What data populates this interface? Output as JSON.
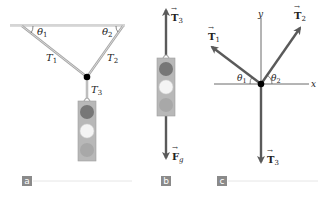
{
  "figure": {
    "panels": [
      {
        "id": "a",
        "tag": "a",
        "description": "Traffic light suspended from ceiling by two cables",
        "labels": {
          "theta1": "θ",
          "theta1_sub": "1",
          "theta2": "θ",
          "theta2_sub": "2",
          "T1": "T",
          "T1_sub": "1",
          "T2": "T",
          "T2_sub": "2",
          "T3": "T",
          "T3_sub": "3"
        }
      },
      {
        "id": "b",
        "tag": "b",
        "description": "Free-body diagram of traffic light",
        "labels": {
          "T3": "T",
          "T3_sub": "3",
          "Fg": "F",
          "Fg_sub": "g"
        }
      },
      {
        "id": "c",
        "tag": "c",
        "description": "Free-body diagram of knot with axes",
        "labels": {
          "y_axis": "y",
          "x_axis": "x",
          "T1": "T",
          "T1_sub": "1",
          "T2": "T",
          "T2_sub": "2",
          "T3": "T",
          "T3_sub": "3",
          "theta1": "θ",
          "theta1_sub": "1",
          "theta2": "θ",
          "theta2_sub": "2"
        }
      }
    ],
    "colors": {
      "ceiling": "#dcdcdc",
      "cable": "#9a9a9a",
      "vector": "#5a5a5a",
      "axis": "#333333",
      "knot": "#000000",
      "light_housing": "#b5b5b5",
      "light_top": "#777777",
      "light_middle": "#f4f4f4",
      "light_bottom": "#a8a8a8",
      "tag_bg": "#8a8a8a",
      "divider": "#e6e6e6"
    }
  }
}
